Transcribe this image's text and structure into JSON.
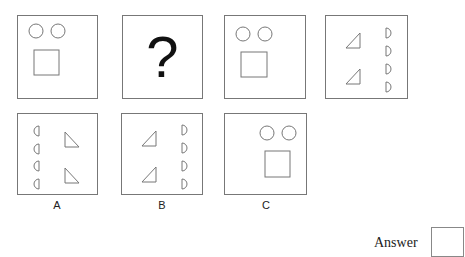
{
  "puzzle": {
    "sequence": [
      {
        "id": "panel-1",
        "content": "two-circles-over-square"
      },
      {
        "id": "panel-2",
        "content": "question-mark",
        "text": "?"
      },
      {
        "id": "panel-3",
        "content": "two-circles-over-square"
      },
      {
        "id": "panel-4",
        "content": "two-triangles-left-four-half-circles-right"
      }
    ],
    "options": [
      {
        "label": "A",
        "content": "four-half-circles-left-two-triangles-right"
      },
      {
        "label": "B",
        "content": "two-triangles-left-four-half-circles-right"
      },
      {
        "label": "C",
        "content": "two-circles-over-square"
      }
    ]
  },
  "answer": {
    "label": "Answer",
    "value": ""
  },
  "colors": {
    "stroke": "#777777",
    "text": "#222222"
  }
}
